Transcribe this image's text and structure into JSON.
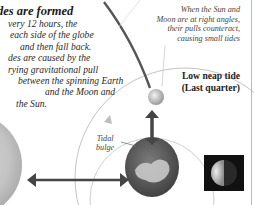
{
  "section": {
    "heading": "des are formed",
    "body_lines": [
      "very 12 hours, the",
      "each side of the globe",
      "and then fall back.",
      "des are caused by the",
      "rying gravitational pull",
      "between the spinning Earth",
      "and the Moon and",
      "the Sun."
    ]
  },
  "caption": {
    "lines": [
      "When the Sun and",
      "Moon are at right angles,",
      "their pulls counteract,",
      "causing small tides"
    ]
  },
  "tide_label": {
    "lines": [
      "Low neap tide",
      "(Last quarter)"
    ]
  },
  "bulge_label": {
    "lines": [
      "Tidal",
      "bulge"
    ]
  },
  "colors": {
    "arrow": "#4a4a4a",
    "orbit_line": "#bbbbbb",
    "earth_ocean": "#5c5c5c",
    "sun": "#c9c9c9",
    "moon_phase_bg": "#111111"
  },
  "icons": {
    "sun": "sun-disc",
    "earth": "earth-globe",
    "moon": "moon-small",
    "moon_phase": "last-quarter-moon"
  }
}
